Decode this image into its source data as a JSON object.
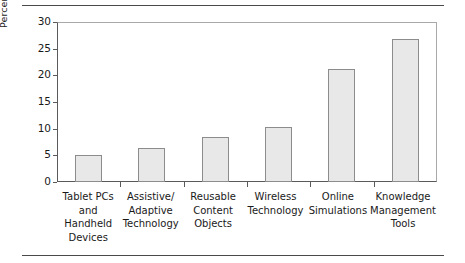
{
  "chart_data": {
    "type": "bar",
    "title": "",
    "subtitle": "",
    "xlabel": "",
    "ylabel": "Percent of Respondents",
    "ylim": [
      0,
      30
    ],
    "ytick_values": [
      0,
      5,
      10,
      15,
      20,
      25,
      30
    ],
    "ytick_labels": [
      "0",
      "5",
      "10",
      "15",
      "20",
      "25",
      "30"
    ],
    "grid": false,
    "legend": null,
    "categories": [
      "Tablet PCs and Handheld Devices",
      "Assistive/ Adaptive Technology",
      "Reusable Content Objects",
      "Wireless Technology",
      "Online Simulations",
      "Knowledge Management Tools"
    ],
    "category_lines": [
      [
        "Tablet PCs",
        "and",
        "Handheld",
        "Devices"
      ],
      [
        "Assistive/",
        "Adaptive",
        "Technology"
      ],
      [
        "Reusable",
        "Content",
        "Objects"
      ],
      [
        "Wireless",
        "Technology"
      ],
      [
        "Online",
        "Simulations"
      ],
      [
        "Knowledge",
        "Management",
        "Tools"
      ]
    ],
    "values": [
      5.0,
      6.3,
      8.5,
      10.4,
      21.2,
      26.8
    ],
    "bar_fill_color": "#e8e8e8",
    "bar_edge_color": "#8c8c8c",
    "axis_color": "#5a5a5a",
    "frame_color": "#a9a9a9",
    "rule_color": "#4a4a4a",
    "background_color": "#ffffff"
  }
}
